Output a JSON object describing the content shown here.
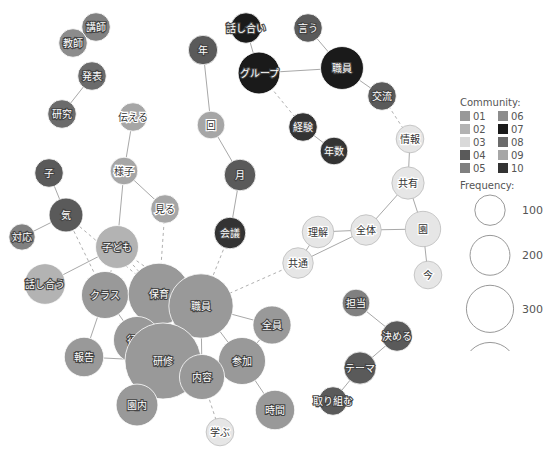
{
  "legend": {
    "community_title": "Community:",
    "frequency_title": "Frequency:",
    "communities": [
      {
        "id": "01",
        "color": "#999999"
      },
      {
        "id": "02",
        "color": "#b3b3b3"
      },
      {
        "id": "03",
        "color": "#d9d9d9"
      },
      {
        "id": "04",
        "color": "#5a5a5a"
      },
      {
        "id": "05",
        "color": "#808080"
      },
      {
        "id": "06",
        "color": "#8c8c8c"
      },
      {
        "id": "07",
        "color": "#1a1a1a"
      },
      {
        "id": "08",
        "color": "#6b6b6b"
      },
      {
        "id": "09",
        "color": "#a6a6a6"
      },
      {
        "id": "10",
        "color": "#333333"
      }
    ],
    "frequencies": [
      100,
      200,
      300,
      400
    ]
  },
  "nodes": [
    {
      "id": "講師",
      "community": "05",
      "freq": 20
    },
    {
      "id": "教師",
      "community": "06",
      "freq": 20
    },
    {
      "id": "発表",
      "community": "08",
      "freq": 20
    },
    {
      "id": "研究",
      "community": "08",
      "freq": 20
    },
    {
      "id": "話し合い",
      "community": "07",
      "freq": 25
    },
    {
      "id": "言う",
      "community": "04",
      "freq": 20
    },
    {
      "id": "グループ",
      "community": "07",
      "freq": 65
    },
    {
      "id": "職員",
      "community": "07",
      "freq": 70
    },
    {
      "id": "交流",
      "community": "04",
      "freq": 20
    },
    {
      "id": "経験",
      "community": "10",
      "freq": 20
    },
    {
      "id": "年数",
      "community": "10",
      "freq": 18
    },
    {
      "id": "伝える",
      "community": "09",
      "freq": 20
    },
    {
      "id": "年",
      "community": "04",
      "freq": 22
    },
    {
      "id": "回",
      "community": "09",
      "freq": 18
    },
    {
      "id": "月",
      "community": "04",
      "freq": 28
    },
    {
      "id": "情報",
      "community": "03",
      "freq": 18
    },
    {
      "id": "様子",
      "community": "09",
      "freq": 18
    },
    {
      "id": "見る",
      "community": "09",
      "freq": 20
    },
    {
      "id": "子",
      "community": "04",
      "freq": 20
    },
    {
      "id": "気",
      "community": "04",
      "freq": 35
    },
    {
      "id": "共有",
      "community": "03",
      "freq": 30
    },
    {
      "id": "対応",
      "community": "05",
      "freq": 15
    },
    {
      "id": "子ども",
      "community": "02",
      "freq": 70
    },
    {
      "id": "会議",
      "community": "10",
      "freq": 28
    },
    {
      "id": "理解",
      "community": "03",
      "freq": 28
    },
    {
      "id": "全体",
      "community": "03",
      "freq": 25
    },
    {
      "id": "園",
      "community": "03",
      "freq": 40
    },
    {
      "id": "共通",
      "community": "03",
      "freq": 25
    },
    {
      "id": "今",
      "community": "03",
      "freq": 18
    },
    {
      "id": "話し合う",
      "community": "02",
      "freq": 60
    },
    {
      "id": "クラス",
      "community": "01",
      "freq": 90
    },
    {
      "id": "保育",
      "community": "01",
      "freq": 180
    },
    {
      "id": "職員2",
      "label": "職員",
      "community": "01",
      "freq": 200
    },
    {
      "id": "全員",
      "community": "01",
      "freq": 50
    },
    {
      "id": "担当",
      "community": "05",
      "freq": 18
    },
    {
      "id": "決める",
      "community": "04",
      "freq": 25
    },
    {
      "id": "行う",
      "community": "01",
      "freq": 90
    },
    {
      "id": "報告",
      "community": "01",
      "freq": 55
    },
    {
      "id": "研修",
      "community": "01",
      "freq": 300
    },
    {
      "id": "参加",
      "community": "01",
      "freq": 90
    },
    {
      "id": "内容",
      "community": "01",
      "freq": 80
    },
    {
      "id": "テーマ",
      "community": "04",
      "freq": 30
    },
    {
      "id": "園内",
      "community": "01",
      "freq": 65
    },
    {
      "id": "取り組む",
      "community": "04",
      "freq": 20
    },
    {
      "id": "時間",
      "community": "01",
      "freq": 55
    },
    {
      "id": "学ぶ",
      "community": "03",
      "freq": 18
    }
  ],
  "edges": [
    {
      "a": "講師",
      "b": "教師",
      "dashed": false
    },
    {
      "a": "発表",
      "b": "研究",
      "dashed": false
    },
    {
      "a": "話し合い",
      "b": "グループ",
      "dashed": false
    },
    {
      "a": "言う",
      "b": "職員",
      "dashed": false
    },
    {
      "a": "グループ",
      "b": "職員",
      "dashed": false
    },
    {
      "a": "職員",
      "b": "交流",
      "dashed": false
    },
    {
      "a": "グループ",
      "b": "経験",
      "dashed": true
    },
    {
      "a": "経験",
      "b": "年数",
      "dashed": false
    },
    {
      "a": "交流",
      "b": "情報",
      "dashed": true
    },
    {
      "a": "情報",
      "b": "共有",
      "dashed": false
    },
    {
      "a": "共有",
      "b": "全体",
      "dashed": false
    },
    {
      "a": "共有",
      "b": "園",
      "dashed": false
    },
    {
      "a": "全体",
      "b": "園",
      "dashed": false
    },
    {
      "a": "理解",
      "b": "全体",
      "dashed": false
    },
    {
      "a": "理解",
      "b": "共通",
      "dashed": false
    },
    {
      "a": "共通",
      "b": "全体",
      "dashed": false
    },
    {
      "a": "園",
      "b": "今",
      "dashed": false
    },
    {
      "a": "年",
      "b": "回",
      "dashed": false
    },
    {
      "a": "回",
      "b": "月",
      "dashed": false
    },
    {
      "a": "月",
      "b": "会議",
      "dashed": false
    },
    {
      "a": "会議",
      "b": "職員2",
      "dashed": true
    },
    {
      "a": "共通",
      "b": "職員2",
      "dashed": true
    },
    {
      "a": "伝える",
      "b": "様子",
      "dashed": false
    },
    {
      "a": "様子",
      "b": "見る",
      "dashed": false
    },
    {
      "a": "様子",
      "b": "子ども",
      "dashed": false
    },
    {
      "a": "見る",
      "b": "保育",
      "dashed": true
    },
    {
      "a": "子",
      "b": "気",
      "dashed": false
    },
    {
      "a": "気",
      "b": "対応",
      "dashed": false
    },
    {
      "a": "気",
      "b": "保育",
      "dashed": true
    },
    {
      "a": "気",
      "b": "クラス",
      "dashed": true
    },
    {
      "a": "子ども",
      "b": "話し合う",
      "dashed": false
    },
    {
      "a": "子ども",
      "b": "クラス",
      "dashed": true
    },
    {
      "a": "子ども",
      "b": "保育",
      "dashed": true
    },
    {
      "a": "子ども",
      "b": "職員2",
      "dashed": true
    },
    {
      "a": "クラス",
      "b": "保育",
      "dashed": false
    },
    {
      "a": "クラス",
      "b": "職員2",
      "dashed": false
    },
    {
      "a": "クラス",
      "b": "行う",
      "dashed": false
    },
    {
      "a": "クラス",
      "b": "報告",
      "dashed": false
    },
    {
      "a": "保育",
      "b": "行う",
      "dashed": false
    },
    {
      "a": "保育",
      "b": "研修",
      "dashed": false
    },
    {
      "a": "保育",
      "b": "内容",
      "dashed": false
    },
    {
      "a": "保育",
      "b": "職員2",
      "dashed": false
    },
    {
      "a": "職員2",
      "b": "行う",
      "dashed": false
    },
    {
      "a": "職員2",
      "b": "研修",
      "dashed": false
    },
    {
      "a": "職員2",
      "b": "全員",
      "dashed": false
    },
    {
      "a": "職員2",
      "b": "参加",
      "dashed": false
    },
    {
      "a": "職員2",
      "b": "内容",
      "dashed": false
    },
    {
      "a": "全員",
      "b": "参加",
      "dashed": false
    },
    {
      "a": "行う",
      "b": "研修",
      "dashed": false
    },
    {
      "a": "行う",
      "b": "園内",
      "dashed": false
    },
    {
      "a": "報告",
      "b": "研修",
      "dashed": false
    },
    {
      "a": "研修",
      "b": "参加",
      "dashed": false
    },
    {
      "a": "研修",
      "b": "内容",
      "dashed": false
    },
    {
      "a": "研修",
      "b": "園内",
      "dashed": false
    },
    {
      "a": "内容",
      "b": "参加",
      "dashed": false
    },
    {
      "a": "参加",
      "b": "時間",
      "dashed": false
    },
    {
      "a": "内容",
      "b": "学ぶ",
      "dashed": true
    },
    {
      "a": "担当",
      "b": "決める",
      "dashed": false
    },
    {
      "a": "決める",
      "b": "テーマ",
      "dashed": false
    },
    {
      "a": "テーマ",
      "b": "取り組む",
      "dashed": false
    }
  ]
}
